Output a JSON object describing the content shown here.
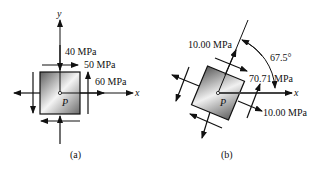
{
  "figure_a": {
    "caption": "(a)",
    "point_label": "P",
    "axis_x_label": "x",
    "axis_y_label": "y",
    "stress_labels": {
      "normal_y": "40 MPa",
      "shear": "50 MPa",
      "normal_x": "60 MPa"
    }
  },
  "figure_b": {
    "caption": "(b)",
    "point_label": "P",
    "axis_x_label": "x",
    "angle_label": "67.5°",
    "stress_labels": {
      "normal_top": "10.00 MPa",
      "shear": "70.71 MPa",
      "normal_right": "10.00 MPa"
    }
  },
  "colors": {
    "stroke": "#111111",
    "fill_dark": "#6b6b6b",
    "fill_light": "#f2f2f2"
  }
}
